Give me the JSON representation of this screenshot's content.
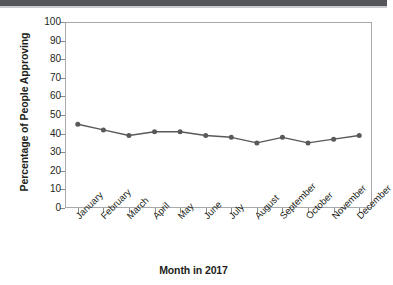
{
  "chart_data": {
    "type": "line",
    "title": "",
    "xlabel": "Month in 2017",
    "ylabel": "Percentage of People Approving",
    "categories": [
      "January",
      "February",
      "March",
      "April",
      "May",
      "June",
      "July",
      "August",
      "September",
      "October",
      "November",
      "December"
    ],
    "values": [
      45,
      42,
      39,
      41,
      41,
      39,
      38,
      35,
      38,
      35,
      37,
      39
    ],
    "series": [
      {
        "name": "Percentage of People Approving",
        "values": [
          45,
          42,
          39,
          41,
          41,
          39,
          38,
          35,
          38,
          35,
          37,
          39
        ]
      }
    ],
    "ylim": [
      0,
      100
    ],
    "y_ticks": [
      0,
      10,
      20,
      30,
      40,
      50,
      60,
      70,
      80,
      90,
      100
    ],
    "y_tick_labels": [
      "0",
      "10",
      "20",
      "30",
      "40",
      "50",
      "60",
      "70",
      "80",
      "90",
      "100"
    ],
    "grid": false,
    "legend": false,
    "legend_position": "none",
    "marker": "circle",
    "line_color": "#58595b",
    "marker_color": "#58595b",
    "axis_color": "#a7a9ac",
    "text_color": "#231f20",
    "plot_background": "#ffffff"
  },
  "page": {
    "top_band_color": "#55565a"
  }
}
